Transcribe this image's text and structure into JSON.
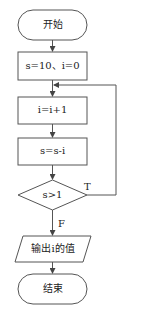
{
  "flowchart": {
    "nodes": [
      {
        "id": "start",
        "type": "terminal",
        "label": "开始"
      },
      {
        "id": "init",
        "type": "process",
        "label": "s=10、i=0"
      },
      {
        "id": "inc",
        "type": "process",
        "label": "i=i+1"
      },
      {
        "id": "sub",
        "type": "process",
        "label": "s=s-i"
      },
      {
        "id": "cond",
        "type": "decision",
        "label": "s>1"
      },
      {
        "id": "output",
        "type": "io",
        "label": "输出i的值"
      },
      {
        "id": "end",
        "type": "terminal",
        "label": "结束"
      }
    ],
    "edges": [
      {
        "from": "start",
        "to": "init",
        "label": ""
      },
      {
        "from": "init",
        "to": "inc",
        "label": ""
      },
      {
        "from": "inc",
        "to": "sub",
        "label": ""
      },
      {
        "from": "sub",
        "to": "cond",
        "label": ""
      },
      {
        "from": "cond",
        "to": "inc",
        "label": "T"
      },
      {
        "from": "cond",
        "to": "output",
        "label": "F"
      },
      {
        "from": "output",
        "to": "end",
        "label": ""
      }
    ],
    "true_label": "T",
    "false_label": "F"
  },
  "colors": {
    "stroke": "#444444",
    "background": "#ffffff",
    "text": "#222222"
  }
}
